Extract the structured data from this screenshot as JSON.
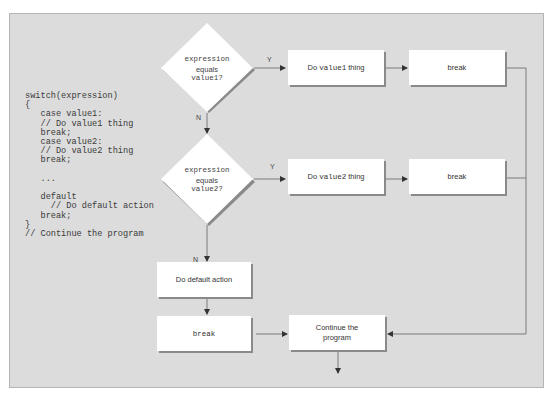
{
  "code": {
    "lines": [
      "switch(expression)",
      "{",
      "   case value1:",
      "   // Do value1 thing",
      "   break;",
      "   case value2:",
      "   // Do value2 thing",
      "   break;",
      "",
      "   ...",
      "",
      "   default",
      "     // Do default action",
      "   break;",
      "}",
      "// Continue the program"
    ]
  },
  "flowchart": {
    "decision1": {
      "line1": "expression",
      "line2": "equals",
      "line3": "value1?"
    },
    "decision2": {
      "line1": "expression",
      "line2": "equals",
      "line3": "value2?"
    },
    "yes_label": "Y",
    "no_label": "N",
    "action1": {
      "prefix": "Do ",
      "code": "value1",
      "suffix": " thing"
    },
    "break1": "break",
    "action2": {
      "prefix": "Do ",
      "code": "value2",
      "suffix": " thing"
    },
    "break2": "break",
    "default_action": "Do default action",
    "break_default": "break",
    "continue": {
      "line1": "Continue the",
      "line2": "program"
    }
  },
  "colors": {
    "panel_bg": "#dcdcdc",
    "box_bg": "#ffffff",
    "line": "#7a7a7a",
    "shadow": "#8a8a8a"
  }
}
